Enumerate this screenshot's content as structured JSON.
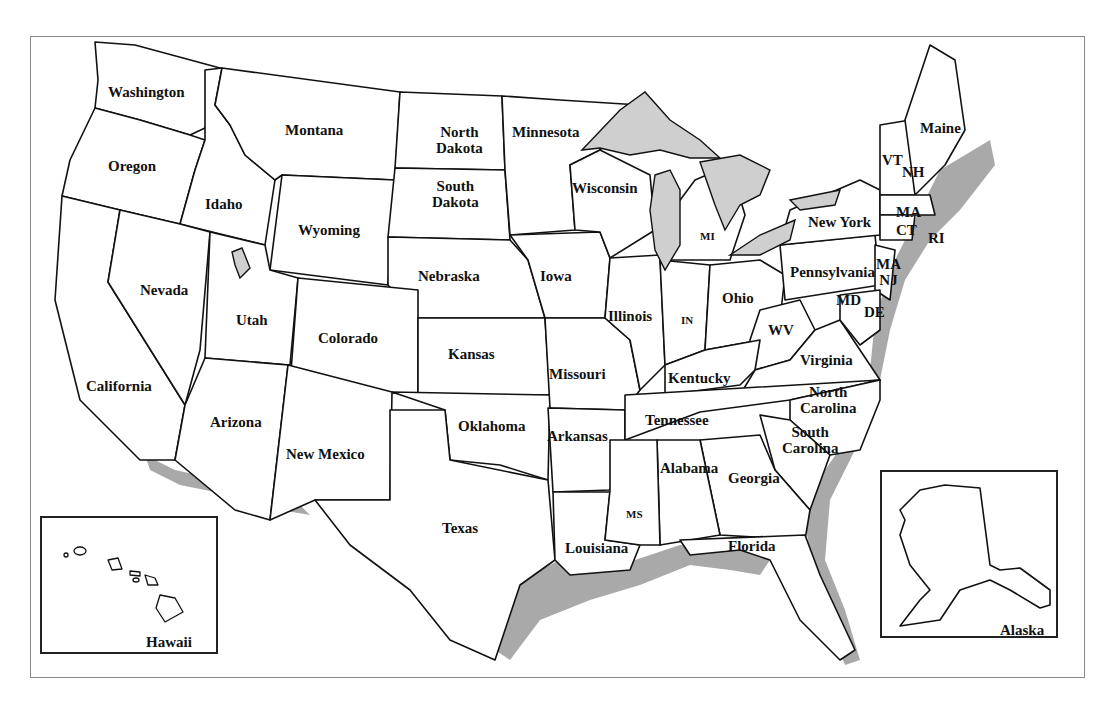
{
  "map": {
    "title": "United States",
    "insets": [
      {
        "name": "Hawaii"
      },
      {
        "name": "Alaska"
      }
    ],
    "labels": [
      {
        "key": "wa",
        "text": "Washington",
        "x": 108,
        "y": 84
      },
      {
        "key": "or",
        "text": "Oregon",
        "x": 108,
        "y": 158
      },
      {
        "key": "id",
        "text": "Idaho",
        "x": 205,
        "y": 196
      },
      {
        "key": "mt",
        "text": "Montana",
        "x": 285,
        "y": 122
      },
      {
        "key": "wy",
        "text": "Wyoming",
        "x": 298,
        "y": 222
      },
      {
        "key": "nd",
        "text": "North\nDakota",
        "x": 436,
        "y": 124
      },
      {
        "key": "sd",
        "text": "South\nDakota",
        "x": 432,
        "y": 178
      },
      {
        "key": "mn",
        "text": "Minnesota",
        "x": 512,
        "y": 124
      },
      {
        "key": "wi",
        "text": "Wisconsin",
        "x": 572,
        "y": 180
      },
      {
        "key": "mi",
        "text": "MI",
        "x": 700,
        "y": 228
      },
      {
        "key": "ny",
        "text": "New York",
        "x": 808,
        "y": 214
      },
      {
        "key": "vt",
        "text": "VT",
        "x": 882,
        "y": 152
      },
      {
        "key": "nh",
        "text": "NH",
        "x": 902,
        "y": 164
      },
      {
        "key": "me",
        "text": "Maine",
        "x": 920,
        "y": 120
      },
      {
        "key": "ma",
        "text": "MA",
        "x": 896,
        "y": 204
      },
      {
        "key": "ct",
        "text": "CT",
        "x": 896,
        "y": 222
      },
      {
        "key": "ri",
        "text": "RI",
        "x": 928,
        "y": 230
      },
      {
        "key": "nv",
        "text": "Nevada",
        "x": 140,
        "y": 282
      },
      {
        "key": "ut",
        "text": "Utah",
        "x": 236,
        "y": 312
      },
      {
        "key": "co",
        "text": "Colorado",
        "x": 318,
        "y": 330
      },
      {
        "key": "ne",
        "text": "Nebraska",
        "x": 418,
        "y": 268
      },
      {
        "key": "ia",
        "text": "Iowa",
        "x": 540,
        "y": 268
      },
      {
        "key": "il",
        "text": "Illinois",
        "x": 608,
        "y": 308
      },
      {
        "key": "in",
        "text": "IN",
        "x": 681,
        "y": 312
      },
      {
        "key": "oh",
        "text": "Ohio",
        "x": 722,
        "y": 290
      },
      {
        "key": "pa",
        "text": "Pennsylvania",
        "x": 790,
        "y": 264
      },
      {
        "key": "nj",
        "text": "MA\nNJ",
        "x": 876,
        "y": 256
      },
      {
        "key": "md",
        "text": "MD",
        "x": 836,
        "y": 292
      },
      {
        "key": "de",
        "text": "DE",
        "x": 864,
        "y": 304
      },
      {
        "key": "wv",
        "text": "WV",
        "x": 768,
        "y": 322
      },
      {
        "key": "va",
        "text": "Virginia",
        "x": 800,
        "y": 352
      },
      {
        "key": "ca",
        "text": "California",
        "x": 86,
        "y": 378
      },
      {
        "key": "ks",
        "text": "Kansas",
        "x": 448,
        "y": 346
      },
      {
        "key": "mo",
        "text": "Missouri",
        "x": 549,
        "y": 366
      },
      {
        "key": "ky",
        "text": "Kentucky",
        "x": 668,
        "y": 370
      },
      {
        "key": "nc",
        "text": "North\nCarolina",
        "x": 800,
        "y": 384
      },
      {
        "key": "tn",
        "text": "Tennessee",
        "x": 645,
        "y": 412
      },
      {
        "key": "az",
        "text": "Arizona",
        "x": 210,
        "y": 414
      },
      {
        "key": "nm",
        "text": "New Mexico",
        "x": 286,
        "y": 446
      },
      {
        "key": "ok",
        "text": "Oklahoma",
        "x": 458,
        "y": 418
      },
      {
        "key": "ar",
        "text": "Arkansas",
        "x": 547,
        "y": 428
      },
      {
        "key": "sc",
        "text": "South\nCarolina",
        "x": 782,
        "y": 424
      },
      {
        "key": "ga",
        "text": "Georgia",
        "x": 728,
        "y": 470
      },
      {
        "key": "al",
        "text": "Alabama",
        "x": 660,
        "y": 460
      },
      {
        "key": "ms",
        "text": "MS",
        "x": 626,
        "y": 506
      },
      {
        "key": "tx",
        "text": "Texas",
        "x": 442,
        "y": 520
      },
      {
        "key": "la",
        "text": "Louisiana",
        "x": 565,
        "y": 540
      },
      {
        "key": "fl",
        "text": "Florida",
        "x": 728,
        "y": 538
      },
      {
        "key": "hi",
        "text": "Hawaii",
        "x": 146,
        "y": 634
      },
      {
        "key": "ak",
        "text": "Alaska",
        "x": 1000,
        "y": 622
      }
    ]
  }
}
